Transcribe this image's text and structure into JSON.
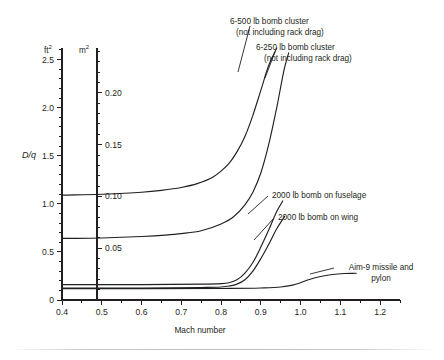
{
  "chart_data": {
    "type": "line",
    "title": "",
    "xlabel": "Mach number",
    "ylabel": "D/q",
    "y_unit_primary": "ft2",
    "y_unit_secondary": "m2",
    "xlim": [
      0.4,
      1.25
    ],
    "ylim": [
      0.0,
      2.62
    ],
    "grid": false,
    "legend": "inline-annotations",
    "xticks": [
      0.4,
      0.5,
      0.6,
      0.7,
      0.8,
      0.9,
      1.0,
      1.1,
      1.2
    ],
    "xtick_labels": [
      "0.4",
      "0.5",
      "0.6",
      "0.7",
      "0.8",
      "0.9",
      "1.0",
      "1.1",
      "1.2"
    ],
    "xminor_step": 0.05,
    "yticks_ft2": [
      0,
      0.5,
      1.0,
      1.5,
      2.0,
      2.5
    ],
    "ytick_labels_ft2": [
      "0",
      "0.5",
      "1.0",
      "1.5",
      "2.0",
      "2.5"
    ],
    "yminor_step_ft2": 0.1,
    "yticks_m2": [
      0.05,
      0.1,
      0.15,
      0.2
    ],
    "ytick_labels_m2": [
      "0.05",
      "0.10",
      "0.15",
      "0.20"
    ],
    "ft2_per_m2": 10.7639,
    "series": [
      {
        "name": "6-500 lb bomb cluster (not including rack drag)",
        "label_line1": "6-500 lb bomb cluster",
        "label_line2": "(not including rack drag)",
        "x": [
          0.4,
          0.5,
          0.6,
          0.65,
          0.7,
          0.74,
          0.78,
          0.8,
          0.82,
          0.84,
          0.86,
          0.88,
          0.9,
          0.92,
          0.94
        ],
        "y": [
          1.09,
          1.1,
          1.12,
          1.14,
          1.17,
          1.21,
          1.28,
          1.34,
          1.42,
          1.54,
          1.7,
          1.92,
          2.18,
          2.44,
          2.62
        ]
      },
      {
        "name": "6-250 lb bomb cluster (not including rack drag)",
        "label_line1": "6-250 lb bomb cluster",
        "label_line2": "(not including rack drag)",
        "x": [
          0.4,
          0.5,
          0.6,
          0.66,
          0.7,
          0.75,
          0.8,
          0.83,
          0.86,
          0.88,
          0.9,
          0.92,
          0.94,
          0.96,
          0.97
        ],
        "y": [
          0.64,
          0.645,
          0.66,
          0.675,
          0.69,
          0.72,
          0.79,
          0.86,
          0.99,
          1.12,
          1.32,
          1.62,
          2.0,
          2.42,
          2.57
        ]
      },
      {
        "name": "2000 lb bomb on fuselage",
        "label_line1": "2000 lb bomb on fuselage",
        "x": [
          0.4,
          0.6,
          0.75,
          0.8,
          0.82,
          0.84,
          0.86,
          0.88,
          0.9,
          0.92,
          0.94,
          0.955
        ],
        "y": [
          0.16,
          0.16,
          0.165,
          0.17,
          0.18,
          0.21,
          0.28,
          0.39,
          0.55,
          0.73,
          0.92,
          1.03
        ]
      },
      {
        "name": "2000 lb bomb on wing",
        "label_line1": "2000 lb bomb on wing",
        "x": [
          0.4,
          0.6,
          0.75,
          0.8,
          0.82,
          0.84,
          0.86,
          0.88,
          0.9,
          0.92,
          0.94,
          0.96
        ],
        "y": [
          0.125,
          0.125,
          0.13,
          0.135,
          0.145,
          0.165,
          0.21,
          0.3,
          0.43,
          0.58,
          0.74,
          0.87
        ]
      },
      {
        "name": "Aim-9 missile and pylon",
        "label_line1": "Aim-9 missile and",
        "label_line2": "pylon",
        "x": [
          0.4,
          0.6,
          0.8,
          0.9,
          0.95,
          0.98,
          1.0,
          1.02,
          1.05,
          1.08,
          1.11,
          1.14
        ],
        "y": [
          0.118,
          0.118,
          0.12,
          0.125,
          0.135,
          0.155,
          0.18,
          0.21,
          0.245,
          0.265,
          0.275,
          0.278
        ]
      }
    ]
  },
  "axes": {
    "unit_primary_label": "ft",
    "unit_primary_sup": "2",
    "unit_secondary_label": "m",
    "unit_secondary_sup": "2",
    "y_axis_title": "D/q",
    "x_axis_title": "Mach number"
  },
  "annotations": {
    "cluster500_l1": "6-500 lb bomb cluster",
    "cluster500_l2": "(not including rack drag)",
    "cluster250_l1": "6-250 lb bomb cluster",
    "cluster250_l2": "(not including rack drag)",
    "bomb_fuselage": "2000 lb bomb on fuselage",
    "bomb_wing": "2000 lb bomb on wing",
    "aim9_l1": "Aim-9 missile and",
    "aim9_l2": "pylon"
  },
  "colors": {
    "ink": "#231f20",
    "background": "#ffffff",
    "rule": "#bdbdbd"
  }
}
